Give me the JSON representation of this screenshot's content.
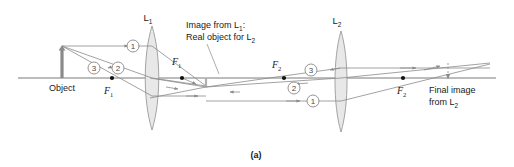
{
  "figure": {
    "caption": "(a)",
    "type": "ray-diagram"
  },
  "labels": {
    "lens1": "L",
    "lens1_sub": "1",
    "lens2": "L",
    "lens2_sub": "2",
    "object": "Object",
    "annotation_line1": "Image from L",
    "annotation_line1_sub": "1",
    "annotation_line1_tail": ":",
    "annotation_line2": "Real object for L",
    "annotation_line2_sub": "2",
    "final_line1": "Final image",
    "final_line2": "from L",
    "final_line2_sub": "2",
    "focal_f1_left": "F",
    "focal_f1_left_sub": "1",
    "focal_f1_right": "F",
    "focal_f1_right_sub": "1",
    "focal_f2_left": "F",
    "focal_f2_left_sub": "2",
    "focal_f2_right": "F",
    "focal_f2_right_sub": "2"
  },
  "rays": {
    "ray1_label": "1",
    "ray2_label": "2",
    "ray3_label": "3",
    "ray1_label_b": "1",
    "ray2_label_b": "2",
    "ray3_label_b": "3"
  },
  "colors": {
    "ray": "#8a8a8a",
    "axis": "#7a7a7a",
    "lens_fill": "#e8e8e8",
    "lens_stroke": "#9a9a9a",
    "text": "#1a1a1a",
    "object": "#808080",
    "background": "#ffffff"
  },
  "geometry": {
    "axis_y": 78,
    "lens1_x": 152,
    "lens2_x": 341,
    "object_x": 62,
    "object_top_y": 47,
    "intermediate_image_x": 206,
    "final_image_x": 448,
    "f1_left_x": 112,
    "f1_right_x": 182,
    "f2_left_x": 284,
    "f2_right_x": 403
  }
}
